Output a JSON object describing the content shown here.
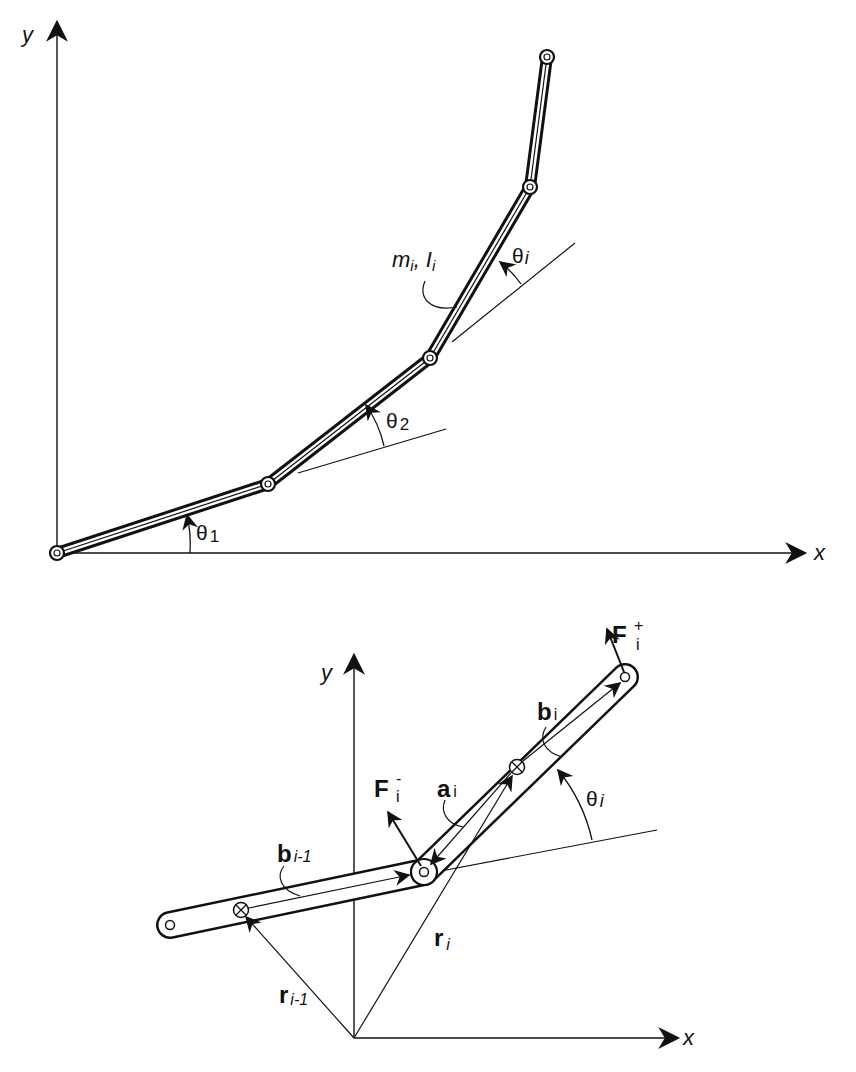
{
  "top_diagram": {
    "axis_y_label": "y",
    "axis_x_label": "x",
    "angle_1": {
      "sym": "θ",
      "sub": "1"
    },
    "angle_2": {
      "sym": "θ",
      "sub": "2"
    },
    "angle_i": {
      "sym": "θ",
      "sub": "i"
    },
    "mass_label": {
      "m": "m",
      "m_sub": "i",
      "sep": ",",
      "I": "I",
      "I_sub": "i"
    }
  },
  "bottom_diagram": {
    "axis_y_label": "y",
    "axis_x_label": "x",
    "force_plus": {
      "sym": "F",
      "sup": "+",
      "sub": "i"
    },
    "force_minus": {
      "sym": "F",
      "sup": "-",
      "sub": "i"
    },
    "vec_b_i": {
      "sym": "b",
      "sub": "i"
    },
    "vec_a_i": {
      "sym": "a",
      "sub": "i"
    },
    "vec_b_im1": {
      "sym": "b",
      "sub": "i-1"
    },
    "vec_r_i": {
      "sym": "r",
      "sub": "i"
    },
    "vec_r_im1": {
      "sym": "r",
      "sub": "i-1"
    },
    "angle_i": {
      "sym": "θ",
      "sub": "i"
    }
  },
  "colors": {
    "ink": "#111111",
    "paper": "#ffffff"
  }
}
